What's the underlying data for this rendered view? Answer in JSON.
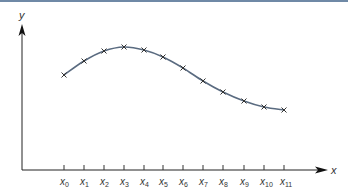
{
  "chart_data": {
    "type": "line",
    "title": "",
    "xlabel": "x",
    "ylabel": "y",
    "grid": false,
    "legend": null,
    "markers": "x",
    "categories": [
      "x0",
      "x1",
      "x2",
      "x3",
      "x4",
      "x5",
      "x6",
      "x7",
      "x8",
      "x9",
      "x10",
      "x11"
    ],
    "tick_labels": [
      {
        "base": "x",
        "sub": "0"
      },
      {
        "base": "x",
        "sub": "1"
      },
      {
        "base": "x",
        "sub": "2"
      },
      {
        "base": "x",
        "sub": "3"
      },
      {
        "base": "x",
        "sub": "4"
      },
      {
        "base": "x",
        "sub": "5"
      },
      {
        "base": "x",
        "sub": "6"
      },
      {
        "base": "x",
        "sub": "7"
      },
      {
        "base": "x",
        "sub": "8"
      },
      {
        "base": "x",
        "sub": "9"
      },
      {
        "base": "x",
        "sub": "10"
      },
      {
        "base": "x",
        "sub": "11"
      }
    ],
    "values_relative": [
      0.66,
      0.76,
      0.83,
      0.86,
      0.85,
      0.8,
      0.72,
      0.63,
      0.55,
      0.48,
      0.44,
      0.42
    ],
    "pixel_points": [
      [
        64,
        75
      ],
      [
        84,
        61
      ],
      [
        104,
        51
      ],
      [
        124,
        47
      ],
      [
        144,
        50
      ],
      [
        163,
        57
      ],
      [
        183,
        68
      ],
      [
        203,
        81
      ],
      [
        223,
        92
      ],
      [
        244,
        101
      ],
      [
        264,
        107
      ],
      [
        284,
        110
      ]
    ],
    "colors": {
      "curve": "#5a6b80",
      "axis": "#222222",
      "marker": "#333333",
      "top_band": "#6f89a6"
    }
  }
}
